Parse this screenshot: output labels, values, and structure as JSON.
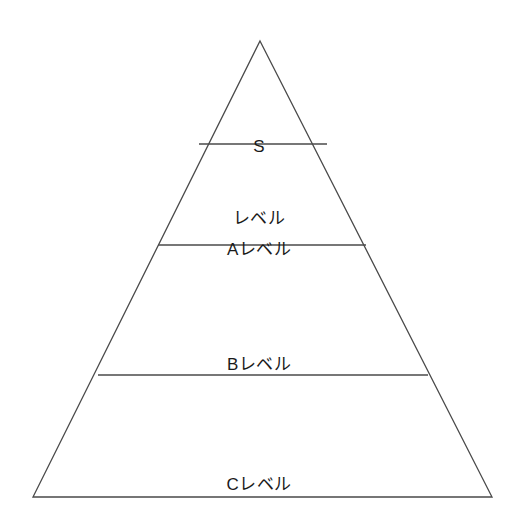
{
  "diagram": {
    "type": "pyramid",
    "title": "",
    "background_color": "#ffffff",
    "stroke_color": "#4a4a4a",
    "text_color": "#1a1a1a",
    "canvas": {
      "width": 518,
      "height": 527
    },
    "outline": {
      "apex": {
        "x": 260,
        "y": 41
      },
      "base_left": {
        "x": 33,
        "y": 497
      },
      "base_right": {
        "x": 492,
        "y": 497
      }
    },
    "dividers": [
      {
        "y": 144,
        "x1": 199,
        "x2": 327
      },
      {
        "y": 245,
        "x1": 158,
        "x2": 366
      },
      {
        "y": 375,
        "x1": 98,
        "x2": 428
      }
    ],
    "tiers": [
      {
        "id": "s",
        "rank": 1,
        "lines": [
          "S",
          "レベル"
        ],
        "full_text": "Sレベル"
      },
      {
        "id": "a",
        "rank": 2,
        "lines": [
          "Aレベル"
        ],
        "full_text": "Aレベル"
      },
      {
        "id": "b",
        "rank": 3,
        "lines": [
          "Bレベル"
        ],
        "full_text": "Bレベル"
      },
      {
        "id": "c",
        "rank": 4,
        "lines": [
          "Cレベル"
        ],
        "full_text": "Cレベル"
      }
    ]
  }
}
